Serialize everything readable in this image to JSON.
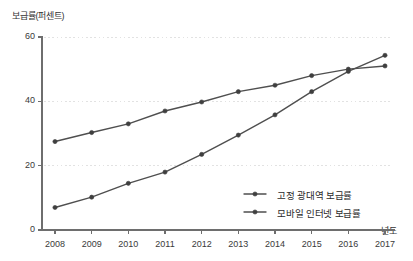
{
  "chart_data": {
    "type": "line",
    "title": "",
    "xlabel": "년도",
    "ylabel": "보급률(퍼센트)",
    "x": [
      2008,
      2009,
      2010,
      2011,
      2012,
      2013,
      2014,
      2015,
      2016,
      2017
    ],
    "categories": [
      "2008",
      "2009",
      "2010",
      "2011",
      "2012",
      "2013",
      "2014",
      "2015",
      "2016",
      "2017"
    ],
    "series": [
      {
        "name": "고정 광대역 보급률",
        "values": [
          27.5,
          30.3,
          33.0,
          37.0,
          39.8,
          43.0,
          45.0,
          48.0,
          50.0,
          51.0
        ]
      },
      {
        "name": "모바일 인터넷 보급률",
        "values": [
          7.0,
          10.2,
          14.5,
          18.0,
          23.5,
          29.5,
          35.8,
          43.0,
          49.3,
          54.3
        ]
      }
    ],
    "ylim": [
      0,
      60
    ],
    "yticks": [
      0,
      20,
      40,
      60
    ],
    "ytick_labels": [
      "0",
      "20",
      "40",
      "60"
    ],
    "grid": true,
    "grid_axis": "y",
    "grid_style": "dotted",
    "legend_position": "inside-bottom-right",
    "colors": {
      "series_line": "#4f4f4f",
      "marker": "#3f3f3f",
      "axis": "#6e6e6e",
      "gridline": "#e2e2e2",
      "text": "#3a3a3a",
      "background": "#ffffff"
    }
  },
  "legend": {
    "items": [
      {
        "label": "고정 광대역 보급률"
      },
      {
        "label": "모바일 인터넷 보급률"
      }
    ]
  }
}
